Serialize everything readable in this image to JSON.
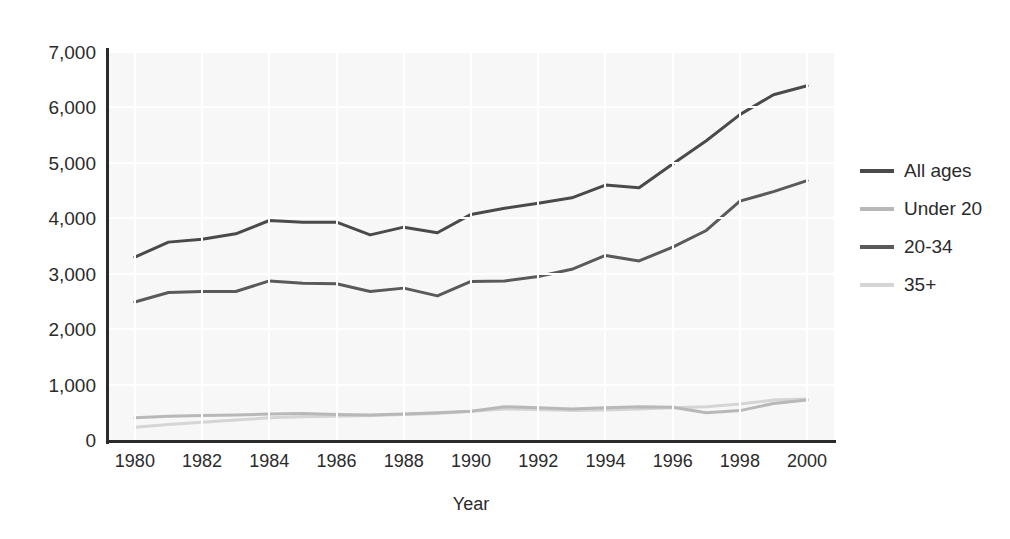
{
  "chart_data": {
    "type": "line",
    "title": "",
    "xlabel": "Year",
    "ylabel": "",
    "xlim": [
      1979.2,
      2000.8
    ],
    "ylim": [
      0,
      7000
    ],
    "grid": true,
    "legend_position": "right",
    "x": [
      1980,
      1981,
      1982,
      1983,
      1984,
      1985,
      1986,
      1987,
      1988,
      1989,
      1990,
      1991,
      1992,
      1993,
      1994,
      1995,
      1996,
      1997,
      1998,
      1999,
      2000
    ],
    "xticks": [
      "1980",
      "1982",
      "1984",
      "1986",
      "1988",
      "1990",
      "1992",
      "1994",
      "1996",
      "1998",
      "2000"
    ],
    "yticks": [
      "0",
      "1,000",
      "2,000",
      "3,000",
      "4,000",
      "5,000",
      "6,000",
      "7,000"
    ],
    "series": [
      {
        "name": "All ages",
        "color": "#4a4a4a",
        "values": [
          3300,
          3570,
          3620,
          3720,
          3960,
          3930,
          3930,
          3700,
          3840,
          3740,
          4070,
          4180,
          4270,
          4370,
          4600,
          4550,
          4980,
          5400,
          5870,
          6230,
          6390
        ]
      },
      {
        "name": "Under 20",
        "color": "#b8b8b8",
        "values": [
          400,
          430,
          440,
          450,
          470,
          480,
          460,
          450,
          470,
          490,
          520,
          600,
          580,
          560,
          580,
          600,
          590,
          490,
          530,
          660,
          720
        ]
      },
      {
        "name": "20-34",
        "color": "#5a5a5a",
        "values": [
          2490,
          2660,
          2680,
          2680,
          2870,
          2830,
          2820,
          2680,
          2740,
          2600,
          2860,
          2870,
          2950,
          3080,
          3330,
          3230,
          3480,
          3780,
          4310,
          4480,
          4680
        ]
      },
      {
        "name": "35+",
        "color": "#d5d5d5",
        "values": [
          230,
          280,
          320,
          360,
          400,
          420,
          430,
          440,
          460,
          480,
          520,
          560,
          550,
          530,
          540,
          560,
          580,
          600,
          650,
          720,
          740
        ]
      }
    ]
  },
  "axis": {
    "x_title": "Year"
  },
  "legend": {
    "entries": [
      {
        "label": "All ages"
      },
      {
        "label": "Under 20"
      },
      {
        "label": "20-34"
      },
      {
        "label": "35+"
      }
    ]
  }
}
